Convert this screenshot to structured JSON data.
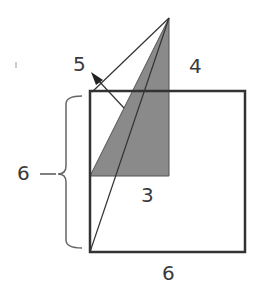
{
  "diagram": {
    "labels": {
      "hypotenuse": "5",
      "triangle_height": "4",
      "triangle_base": "3",
      "square_side_left": "6",
      "square_side_bottom": "6"
    },
    "colors": {
      "stroke": "#333333",
      "shade": "#8a8a8a",
      "brace": "#555555"
    },
    "shapes": {
      "square": {
        "side": 6
      },
      "triangle": {
        "legs": [
          3,
          4
        ],
        "hypotenuse": 5
      }
    }
  }
}
